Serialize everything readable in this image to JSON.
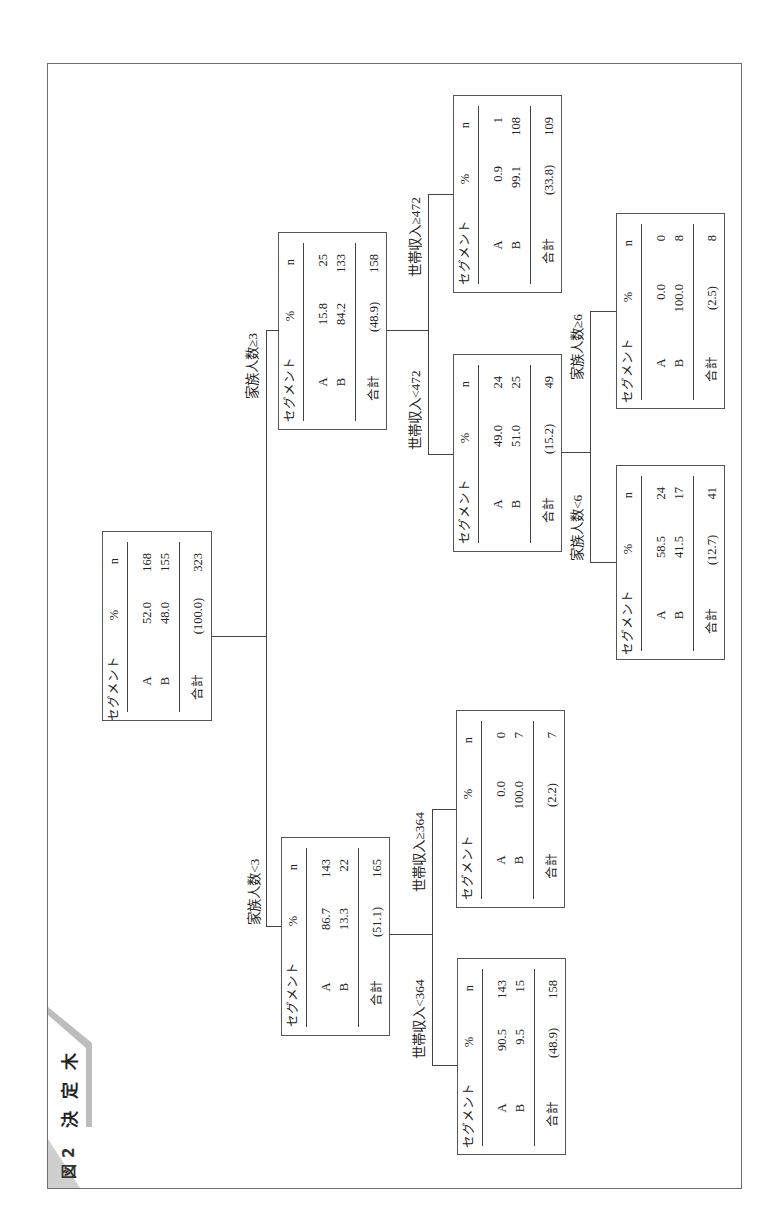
{
  "figure": {
    "number_label": "図2",
    "title": "決定木"
  },
  "table_header": {
    "segment": "セグメント",
    "pct": "%",
    "n": "n"
  },
  "total_label": "合計",
  "nodes": [
    {
      "condition": null,
      "rows": [
        {
          "segment": "A",
          "pct": "52.0",
          "n": "168"
        },
        {
          "segment": "B",
          "pct": "48.0",
          "n": "155"
        }
      ],
      "total": {
        "pct": "(100.0)",
        "n": "323"
      }
    },
    {
      "condition": "家族人数<3",
      "rows": [
        {
          "segment": "A",
          "pct": "86.7",
          "n": "143"
        },
        {
          "segment": "B",
          "pct": "13.3",
          "n": "22"
        }
      ],
      "total": {
        "pct": "(51.1)",
        "n": "165"
      }
    },
    {
      "condition": "家族人数≥3",
      "rows": [
        {
          "segment": "A",
          "pct": "15.8",
          "n": "25"
        },
        {
          "segment": "B",
          "pct": "84.2",
          "n": "133"
        }
      ],
      "total": {
        "pct": "(48.9)",
        "n": "158"
      }
    },
    {
      "condition": "世帯収入<364",
      "rows": [
        {
          "segment": "A",
          "pct": "90.5",
          "n": "143"
        },
        {
          "segment": "B",
          "pct": "9.5",
          "n": "15"
        }
      ],
      "total": {
        "pct": "(48.9)",
        "n": "158"
      }
    },
    {
      "condition": "世帯収入≥364",
      "rows": [
        {
          "segment": "A",
          "pct": "0.0",
          "n": "0"
        },
        {
          "segment": "B",
          "pct": "100.0",
          "n": "7"
        }
      ],
      "total": {
        "pct": "(2.2)",
        "n": "7"
      }
    },
    {
      "condition": "世帯収入<472",
      "rows": [
        {
          "segment": "A",
          "pct": "49.0",
          "n": "24"
        },
        {
          "segment": "B",
          "pct": "51.0",
          "n": "25"
        }
      ],
      "total": {
        "pct": "(15.2)",
        "n": "49"
      }
    },
    {
      "condition": "世帯収入≥472",
      "rows": [
        {
          "segment": "A",
          "pct": "0.9",
          "n": "1"
        },
        {
          "segment": "B",
          "pct": "99.1",
          "n": "108"
        }
      ],
      "total": {
        "pct": "(33.8)",
        "n": "109"
      }
    },
    {
      "condition": "家族人数<6",
      "rows": [
        {
          "segment": "A",
          "pct": "58.5",
          "n": "24"
        },
        {
          "segment": "B",
          "pct": "41.5",
          "n": "17"
        }
      ],
      "total": {
        "pct": "(12.7)",
        "n": "41"
      }
    },
    {
      "condition": "家族人数≥6",
      "rows": [
        {
          "segment": "A",
          "pct": "0.0",
          "n": "0"
        },
        {
          "segment": "B",
          "pct": "100.0",
          "n": "8"
        }
      ],
      "total": {
        "pct": "(2.5)",
        "n": "8"
      }
    }
  ]
}
